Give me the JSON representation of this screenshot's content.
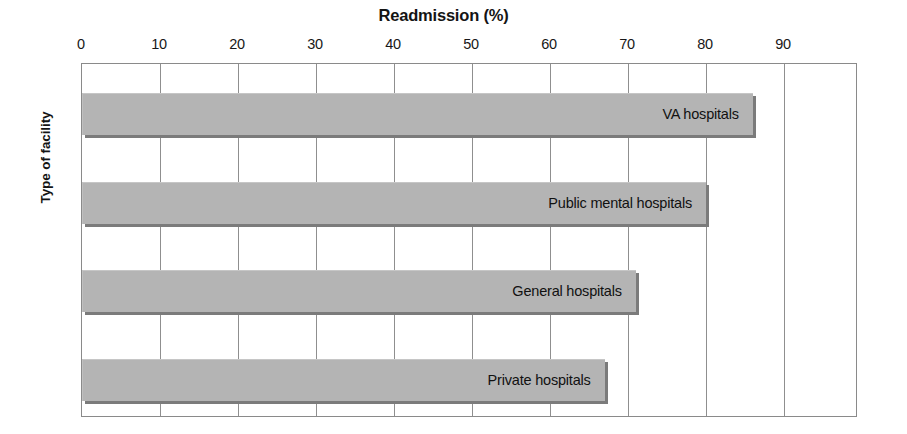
{
  "chart_data": {
    "type": "bar",
    "orientation": "horizontal",
    "title": "Readmission (%)",
    "xlabel": "Readmission (%)",
    "ylabel": "Type of facility",
    "categories": [
      "VA hospitals",
      "Public mental hospitals",
      "General hospitals",
      "Private hospitals"
    ],
    "values": [
      86,
      80,
      71,
      67
    ],
    "xlim": [
      0,
      100
    ],
    "xticks": [
      0,
      10,
      20,
      30,
      40,
      50,
      60,
      70,
      80,
      90
    ],
    "xtick_labels": [
      "0",
      "10",
      "20",
      "30",
      "40",
      "50",
      "60",
      "70",
      "80",
      "90"
    ],
    "grid": "vertical",
    "legend": "none",
    "bar_fill_color": "#b4b4b4",
    "bar_shadow_color": "#7b7b7b",
    "axis_color": "#8a8a8a",
    "text_color": "#141414",
    "bars": [
      {
        "label": "VA hospitals",
        "value": 86
      },
      {
        "label": "Public mental hospitals",
        "value": 80
      },
      {
        "label": "General hospitals",
        "value": 71
      },
      {
        "label": "Private hospitals",
        "value": 67
      }
    ]
  }
}
